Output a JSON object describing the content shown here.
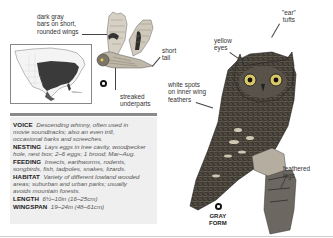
{
  "callouts": {
    "wing_bars": "dark gray bars on short, rounded wings",
    "wing_bars_lines": [
      "dark gray",
      "bars on short,",
      "rounded wings"
    ],
    "short_tail": [
      "short",
      "tail"
    ],
    "streaked_underparts": [
      "streaked",
      "underparts"
    ],
    "yellow_eyes": [
      "yellow",
      "eyes"
    ],
    "ear_tufts": [
      "\"ear\"",
      "tufts"
    ],
    "white_spots": [
      "white spots",
      "on inner wing",
      "feathers"
    ],
    "feathered_legs": [
      "feathered",
      "legs"
    ]
  },
  "form_label": [
    "GRAY",
    "FORM"
  ],
  "info": [
    {
      "key": "VOICE",
      "lines": [
        "Descending whinny, often used in",
        "movie soundtracks; also an even trill,",
        "occasional barks and screeches."
      ]
    },
    {
      "key": "NESTING",
      "lines": [
        "Lays eggs in tree cavity, woodpecker",
        "hole, nest box; 2–6 eggs; 1 brood; Mar–Aug."
      ]
    },
    {
      "key": "FEEDING",
      "lines": [
        "Insects, earthworms, rodents,",
        "songbirds, fish, tadpoles, snakes, lizards."
      ]
    },
    {
      "key": "HABITAT",
      "lines": [
        "Variety of different lowland wooded",
        "areas; suburban and urban parks; usually",
        "avoids mountain forests."
      ]
    },
    {
      "key": "LENGTH",
      "lines": [
        "6½–10in (16–25cm)"
      ]
    },
    {
      "key": "WINGSPAN",
      "lines": [
        "19–24in (48–61cm)"
      ]
    }
  ],
  "colors": {
    "range_fill": "#3a3a3a",
    "info_bg": "#efefef",
    "rule": "#8a8a8a"
  }
}
